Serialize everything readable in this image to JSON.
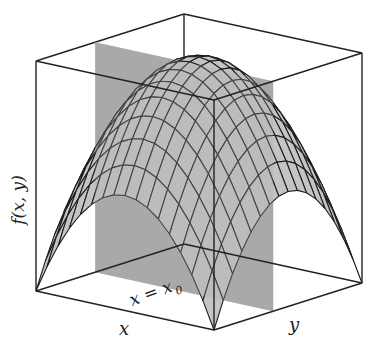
{
  "figure": {
    "labels": {
      "z_axis": "f(x, y)",
      "x_axis": "x",
      "y_axis": "y",
      "plane": "x = x₀",
      "plane_main": "x = x",
      "plane_sub": "0"
    },
    "colors": {
      "surface": "#c4c4c4",
      "mesh": "#1e1e1e",
      "plane": "#a9a9a9",
      "box": "#222222",
      "background": "#ffffff"
    },
    "mesh_divisions": 16,
    "box_corners_px": {
      "floor_back": [
        184,
        244
      ],
      "floor_left": [
        36,
        291
      ],
      "floor_right": [
        362,
        283
      ],
      "floor_front": [
        214,
        330
      ],
      "height": 230
    }
  }
}
